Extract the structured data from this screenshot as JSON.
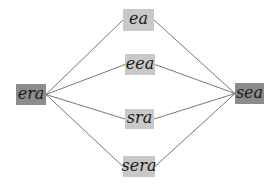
{
  "diagram": {
    "type": "graph",
    "colors": {
      "endpoint_fill": "#8c8c8c",
      "intermediate_fill": "#c8c8c8",
      "edge": "#555555",
      "background": "#ffffff"
    },
    "nodes": [
      {
        "id": "era",
        "label": "era",
        "kind": "endpoint",
        "x": 16,
        "y": 84,
        "w": 30,
        "h": 21
      },
      {
        "id": "ea",
        "label": "ea",
        "kind": "intermediate",
        "x": 123,
        "y": 9,
        "w": 31,
        "h": 22
      },
      {
        "id": "eea",
        "label": "eea",
        "kind": "intermediate",
        "x": 125,
        "y": 54,
        "w": 30,
        "h": 21
      },
      {
        "id": "sra",
        "label": "sra",
        "kind": "intermediate",
        "x": 125,
        "y": 109,
        "w": 29,
        "h": 20
      },
      {
        "id": "sera",
        "label": "sera",
        "kind": "intermediate",
        "x": 123,
        "y": 156,
        "w": 32,
        "h": 21
      },
      {
        "id": "sea",
        "label": "sea",
        "kind": "endpoint",
        "x": 235,
        "y": 83,
        "w": 29,
        "h": 21
      }
    ],
    "edges": [
      {
        "from": "era",
        "to": "ea"
      },
      {
        "from": "era",
        "to": "eea"
      },
      {
        "from": "era",
        "to": "sra"
      },
      {
        "from": "era",
        "to": "sera"
      },
      {
        "from": "ea",
        "to": "sea"
      },
      {
        "from": "eea",
        "to": "sea"
      },
      {
        "from": "sra",
        "to": "sea"
      },
      {
        "from": "sera",
        "to": "sea"
      }
    ]
  }
}
